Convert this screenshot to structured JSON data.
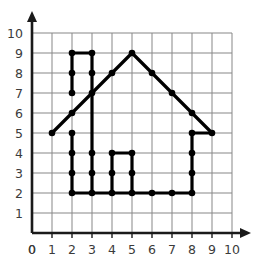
{
  "chart_data": {
    "type": "scatter",
    "title": "",
    "xlabel": "",
    "ylabel": "",
    "xlim": [
      0,
      10
    ],
    "ylim": [
      0,
      10
    ],
    "grid": true,
    "legend": false,
    "x_ticks": [
      "0",
      "1",
      "2",
      "3",
      "4",
      "5",
      "6",
      "7",
      "8",
      "9",
      "10"
    ],
    "y_ticks": [
      "1",
      "2",
      "3",
      "4",
      "5",
      "6",
      "7",
      "8",
      "9",
      "10"
    ],
    "x_tick_values": [
      0,
      1,
      2,
      3,
      4,
      5,
      6,
      7,
      8,
      9,
      10
    ],
    "y_tick_values": [
      1,
      2,
      3,
      4,
      5,
      6,
      7,
      8,
      9,
      10
    ],
    "shapes": [
      {
        "name": "house-outline",
        "closed": true,
        "points": [
          [
            1,
            5
          ],
          [
            2,
            6
          ],
          [
            2,
            7
          ],
          [
            2,
            8
          ],
          [
            2,
            9
          ],
          [
            3,
            9
          ],
          [
            3,
            8
          ],
          [
            3,
            7
          ],
          [
            4,
            8
          ],
          [
            5,
            9
          ],
          [
            6,
            8
          ],
          [
            7,
            7
          ],
          [
            8,
            6
          ],
          [
            9,
            5
          ],
          [
            8,
            5
          ],
          [
            8,
            4
          ],
          [
            8,
            3
          ],
          [
            8,
            2
          ],
          [
            7,
            2
          ],
          [
            6,
            2
          ],
          [
            5,
            2
          ],
          [
            4,
            2
          ],
          [
            3,
            2
          ],
          [
            2,
            2
          ],
          [
            2,
            3
          ],
          [
            2,
            4
          ],
          [
            2,
            5
          ]
        ]
      },
      {
        "name": "window-rectangle",
        "closed": true,
        "points": [
          [
            4,
            2
          ],
          [
            4,
            3
          ],
          [
            4,
            4
          ],
          [
            5,
            4
          ],
          [
            5,
            3
          ],
          [
            5,
            2
          ]
        ]
      }
    ],
    "segments": [
      {
        "name": "left-eave",
        "from": [
          1,
          5
        ],
        "to": [
          3,
          7
        ]
      },
      {
        "name": "chimney-left",
        "from": [
          2,
          7
        ],
        "to": [
          2,
          9
        ]
      },
      {
        "name": "chimney-top",
        "from": [
          2,
          9
        ],
        "to": [
          3,
          9
        ]
      },
      {
        "name": "chimney-right",
        "from": [
          3,
          9
        ],
        "to": [
          3,
          7
        ]
      },
      {
        "name": "roof-left-slope",
        "from": [
          3,
          7
        ],
        "to": [
          5,
          9
        ]
      },
      {
        "name": "roof-right-slope",
        "from": [
          5,
          9
        ],
        "to": [
          9,
          5
        ]
      },
      {
        "name": "right-eave-base",
        "from": [
          9,
          5
        ],
        "to": [
          8,
          5
        ]
      },
      {
        "name": "right-wall",
        "from": [
          8,
          5
        ],
        "to": [
          8,
          2
        ]
      },
      {
        "name": "house-base",
        "from": [
          8,
          2
        ],
        "to": [
          2,
          2
        ]
      },
      {
        "name": "left-wall-lower",
        "from": [
          2,
          5
        ],
        "to": [
          2,
          2
        ]
      },
      {
        "name": "left-wall-upper",
        "from": [
          3,
          7
        ],
        "to": [
          3,
          2
        ]
      },
      {
        "name": "window-left",
        "from": [
          4,
          2
        ],
        "to": [
          4,
          4
        ]
      },
      {
        "name": "window-top",
        "from": [
          4,
          4
        ],
        "to": [
          5,
          4
        ]
      },
      {
        "name": "window-right",
        "from": [
          5,
          4
        ],
        "to": [
          5,
          2
        ]
      }
    ],
    "marked_points": [
      [
        1,
        5
      ],
      [
        2,
        5
      ],
      [
        2,
        6
      ],
      [
        2,
        7
      ],
      [
        2,
        8
      ],
      [
        2,
        9
      ],
      [
        3,
        9
      ],
      [
        3,
        8
      ],
      [
        3,
        7
      ],
      [
        4,
        8
      ],
      [
        5,
        9
      ],
      [
        6,
        8
      ],
      [
        7,
        7
      ],
      [
        8,
        6
      ],
      [
        9,
        5
      ],
      [
        8,
        5
      ],
      [
        8,
        4
      ],
      [
        8,
        3
      ],
      [
        8,
        2
      ],
      [
        7,
        2
      ],
      [
        6,
        2
      ],
      [
        5,
        2
      ],
      [
        4,
        2
      ],
      [
        3,
        2
      ],
      [
        2,
        2
      ],
      [
        2,
        3
      ],
      [
        2,
        4
      ],
      [
        3,
        3
      ],
      [
        3,
        4
      ],
      [
        4,
        3
      ],
      [
        4,
        4
      ],
      [
        5,
        4
      ],
      [
        5,
        3
      ]
    ],
    "colors": {
      "line": "#000000",
      "point": "#000000",
      "grid": "#878787",
      "axis": "#1a1a1a",
      "tick_label": "#3b3b3b",
      "background": "#ffffff"
    }
  },
  "axes": {
    "x_axis_name": "x-axis",
    "y_axis_name": "y-axis",
    "origin_label": "0"
  }
}
